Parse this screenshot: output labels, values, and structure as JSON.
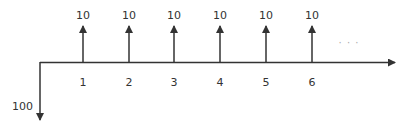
{
  "diagram": {
    "type": "cash-flow-timeline",
    "line_color": "#333333",
    "initial_outflow": {
      "label": "100",
      "direction": "down"
    },
    "periods": [
      {
        "period": "1",
        "inflow": "10"
      },
      {
        "period": "2",
        "inflow": "10"
      },
      {
        "period": "3",
        "inflow": "10"
      },
      {
        "period": "4",
        "inflow": "10"
      },
      {
        "period": "5",
        "inflow": "10"
      },
      {
        "period": "6",
        "inflow": "10"
      }
    ],
    "continuation": "· · ·"
  }
}
